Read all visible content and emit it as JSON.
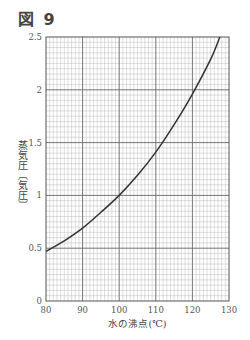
{
  "figure": {
    "title": "図 9"
  },
  "chart_data": {
    "type": "line",
    "title": "図 9",
    "xlabel": "水の沸点(℃)",
    "ylabel": "蒸気圧〔気圧〕",
    "xlim": [
      80,
      130
    ],
    "ylim": [
      0,
      2.5
    ],
    "x_ticks": [
      80,
      90,
      100,
      110,
      120,
      130
    ],
    "x_tick_labels": [
      "80",
      "90",
      "100",
      "110",
      "120",
      "130"
    ],
    "y_ticks": [
      0,
      0.5,
      1,
      1.5,
      2,
      2.5
    ],
    "y_tick_labels": [
      "0",
      "0.5",
      "1",
      "1.5",
      "2",
      "2.5"
    ],
    "x_minor_step": 1,
    "y_minor_step": 0.05,
    "grid": true,
    "legend": "none",
    "series": [
      {
        "name": "vapor pressure of water",
        "color": "#333333",
        "x": [
          80,
          85,
          90,
          95,
          100,
          105,
          110,
          115,
          120,
          125,
          127.5
        ],
        "y": [
          0.47,
          0.57,
          0.69,
          0.84,
          1.0,
          1.19,
          1.41,
          1.67,
          1.96,
          2.29,
          2.5
        ]
      }
    ]
  }
}
